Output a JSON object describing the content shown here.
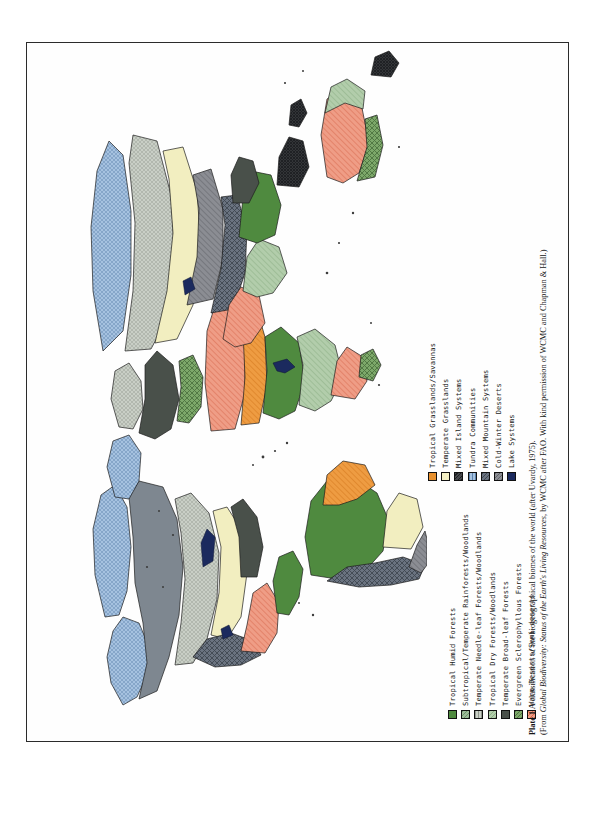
{
  "plate": {
    "caption_line1_bold": "Plate 1",
    "caption_line1": " A classification of the biogeographical biomes of the world (after Uvardy, 1975).",
    "caption_line2_prefix": "(From ",
    "caption_line2_italic": "Global Biodiversity: Status of the Earth's Living Resources",
    "caption_line2_suffix": ", by WCMC after FAO. With kind permission of WCMC and Chapman & Hall.)"
  },
  "legend": {
    "column1": [
      {
        "label": "Tropical Humid Forests",
        "color": "#4f8a3f",
        "pattern": "solid-dark-green"
      },
      {
        "label": "Subtropical/Temperate Rainforests/Woodlands",
        "color": "#9cb89a",
        "pattern": "vhatch-green"
      },
      {
        "label": "Temperate Needle-leaf Forests/Woodlands",
        "color": "#c9cfc6",
        "pattern": "dots-gray"
      },
      {
        "label": "Tropical Dry Forests/Woodlands",
        "color": "#a9c3a0",
        "pattern": "hatch-lightgreen"
      },
      {
        "label": "Temperate Broad-leaf Forests",
        "color": "#4a5a4a",
        "pattern": "solid-darkslate"
      },
      {
        "label": "Evergreen Sclerophyllous Forests",
        "color": "#6f9a5c",
        "pattern": "crosshatch-green"
      },
      {
        "label": "Warm Deserts/Semi-deserts",
        "color": "#e8907c",
        "pattern": "hatch-salmon"
      }
    ],
    "column2": [
      {
        "label": "Tropical Grasslands/Savannas",
        "color": "#e8912f",
        "pattern": "solid-orange"
      },
      {
        "label": "Temperate Grasslands",
        "color": "#f4f0c4",
        "pattern": "solid-cream"
      },
      {
        "label": "Mixed Island Systems",
        "color": "#3c3c3c",
        "pattern": "dense-dark"
      },
      {
        "label": "Tundra Communities",
        "color": "#8fb0d6",
        "pattern": "dots-blue"
      },
      {
        "label": "Mixed Mountain Systems",
        "color": "#5a6472",
        "pattern": "crosshatch-slate"
      },
      {
        "label": "Cold-Winter Deserts",
        "color": "#7d7f86",
        "pattern": "hatch-gray"
      },
      {
        "label": "Lake Systems",
        "color": "#1b2a5e",
        "pattern": "solid-navy"
      }
    ]
  },
  "map": {
    "title": "Biogeographical biomes of the world",
    "projection": "world-outline",
    "regions": [
      {
        "name": "north-america-boreal",
        "biome": "Temperate Needle-leaf Forests/Woodlands"
      },
      {
        "name": "north-america-arctic",
        "biome": "Tundra Communities"
      },
      {
        "name": "north-america-prairie",
        "biome": "Temperate Grasslands"
      },
      {
        "name": "north-america-rockies",
        "biome": "Mixed Mountain Systems"
      },
      {
        "name": "north-america-southwest",
        "biome": "Warm Deserts/Semi-deserts"
      },
      {
        "name": "central-america",
        "biome": "Tropical Humid Forests"
      },
      {
        "name": "amazon-basin",
        "biome": "Tropical Humid Forests"
      },
      {
        "name": "south-america-cerrado",
        "biome": "Tropical Grasslands/Savannas"
      },
      {
        "name": "south-america-andes",
        "biome": "Mixed Mountain Systems"
      },
      {
        "name": "pampas",
        "biome": "Temperate Grasslands"
      },
      {
        "name": "patagonia",
        "biome": "Cold-Winter Deserts"
      },
      {
        "name": "sahara",
        "biome": "Warm Deserts/Semi-deserts"
      },
      {
        "name": "sahel",
        "biome": "Tropical Grasslands/Savannas"
      },
      {
        "name": "congo-basin",
        "biome": "Tropical Humid Forests"
      },
      {
        "name": "southern-africa",
        "biome": "Tropical Dry Forests/Woodlands"
      },
      {
        "name": "kalahari",
        "biome": "Warm Deserts/Semi-deserts"
      },
      {
        "name": "europe-temperate",
        "biome": "Temperate Broad-leaf Forests"
      },
      {
        "name": "scandinavia",
        "biome": "Temperate Needle-leaf Forests/Woodlands"
      },
      {
        "name": "siberia-taiga",
        "biome": "Temperate Needle-leaf Forests/Woodlands"
      },
      {
        "name": "siberia-tundra",
        "biome": "Tundra Communities"
      },
      {
        "name": "central-asia-steppe",
        "biome": "Temperate Grasslands"
      },
      {
        "name": "gobi",
        "biome": "Cold-Winter Deserts"
      },
      {
        "name": "himalaya",
        "biome": "Mixed Mountain Systems"
      },
      {
        "name": "arabian-peninsula",
        "biome": "Warm Deserts/Semi-deserts"
      },
      {
        "name": "india-subcontinent",
        "biome": "Tropical Dry Forests/Woodlands"
      },
      {
        "name": "southeast-asia",
        "biome": "Tropical Humid Forests"
      },
      {
        "name": "indonesia",
        "biome": "Mixed Island Systems"
      },
      {
        "name": "australia-interior",
        "biome": "Warm Deserts/Semi-deserts"
      },
      {
        "name": "australia-coastal",
        "biome": "Tropical Dry Forests/Woodlands"
      },
      {
        "name": "new-zealand",
        "biome": "Mixed Island Systems"
      },
      {
        "name": "greenland",
        "biome": "Tundra Communities"
      }
    ]
  }
}
